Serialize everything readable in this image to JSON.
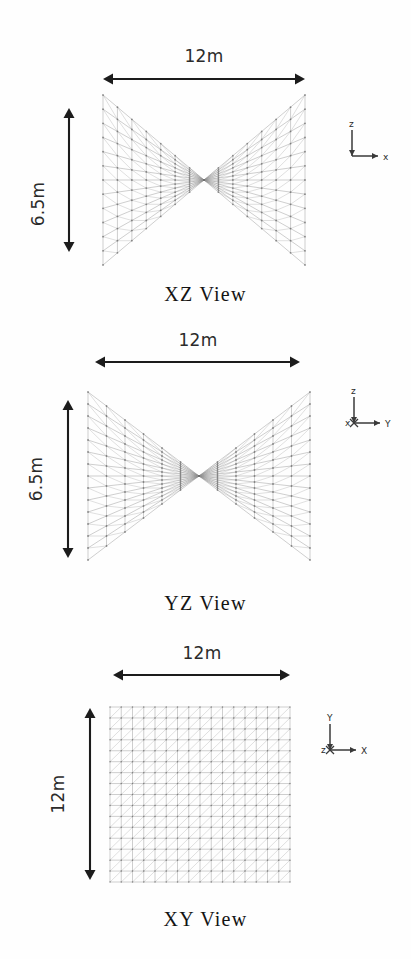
{
  "figure": {
    "background_color": "#fefefe",
    "mesh_color": "#8e8e8e",
    "arrow_color": "#1c1c1c",
    "caption_color": "#141414"
  },
  "geometry": {
    "plan_span_x_m": 12,
    "plan_span_y_m": 12,
    "rise_m": 6.5,
    "grid_divisions": 16,
    "surface": "hyperbolic-paraboloid"
  },
  "views": [
    {
      "id": "xz",
      "caption": "XZ View",
      "top_dimension": "12m",
      "side_dimension": "6.5m",
      "axes": {
        "up": "z",
        "right": "x",
        "origin": ""
      },
      "mesh": {
        "projection": "xz",
        "x": 103,
        "y": 95,
        "w": 202,
        "h": 170,
        "u_divisions": 14,
        "v_divisions": 12
      },
      "top_arrow": {
        "x1": 103,
        "x2": 305,
        "y": 79
      },
      "side_arrow": {
        "y1": 108,
        "y2": 252,
        "x": 69
      },
      "top_label_pos": {
        "x": 204,
        "y": 46
      },
      "side_label_pos": {
        "x": 38,
        "y": 205
      },
      "triad_pos": {
        "x": 340,
        "y": 118
      },
      "caption_pos": {
        "y": 283
      }
    },
    {
      "id": "yz",
      "caption": "YZ View",
      "top_dimension": "12m",
      "side_dimension": "6.5m",
      "axes": {
        "up": "z",
        "right": "Y",
        "origin": "x"
      },
      "mesh": {
        "projection": "yz",
        "x": 88,
        "y": 392,
        "w": 222,
        "h": 168,
        "u_divisions": 14,
        "v_divisions": 12
      },
      "top_arrow": {
        "x1": 95,
        "x2": 300,
        "y": 362
      },
      "side_arrow": {
        "y1": 400,
        "y2": 558,
        "x": 68
      },
      "top_label_pos": {
        "x": 198,
        "y": 330
      },
      "side_label_pos": {
        "x": 36,
        "y": 480
      },
      "triad_pos": {
        "x": 342,
        "y": 385
      },
      "caption_pos": {
        "y": 592
      }
    },
    {
      "id": "xy",
      "caption": "XY View",
      "top_dimension": "12m",
      "side_dimension": "12m",
      "axes": {
        "up": "Y",
        "right": "X",
        "origin": "z"
      },
      "mesh": {
        "projection": "xy",
        "x": 110,
        "y": 707,
        "w": 180,
        "h": 175,
        "u_divisions": 16,
        "v_divisions": 16
      },
      "top_arrow": {
        "x1": 113,
        "x2": 290,
        "y": 675
      },
      "side_arrow": {
        "y1": 708,
        "y2": 880,
        "x": 90
      },
      "top_label_pos": {
        "x": 202,
        "y": 643
      },
      "side_label_pos": {
        "x": 58,
        "y": 795
      },
      "triad_pos": {
        "x": 318,
        "y": 712
      },
      "caption_pos": {
        "y": 908
      }
    }
  ]
}
